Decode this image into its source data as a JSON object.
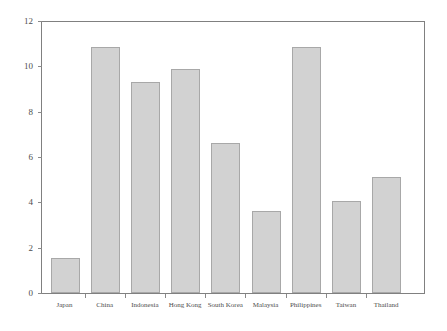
{
  "chart_data": {
    "type": "bar",
    "title": "",
    "subtitle": "",
    "xlabel": "",
    "ylabel": "",
    "categories": [
      "Japan",
      "China",
      "Indonesia",
      "Hong Kong",
      "South Korea",
      "Malaysia",
      "Philippines",
      "Taiwan",
      "Thailand"
    ],
    "values": [
      1.55,
      10.85,
      9.3,
      9.9,
      6.6,
      3.6,
      10.85,
      4.05,
      5.1
    ],
    "series": [
      {
        "name": "",
        "values": [
          1.55,
          10.85,
          9.3,
          9.9,
          6.6,
          3.6,
          10.85,
          4.05,
          5.1
        ]
      }
    ],
    "ylim": [
      0,
      12
    ],
    "yticks": [
      0,
      2,
      4,
      6,
      8,
      10,
      12
    ],
    "ytick_labels": [
      "0",
      "2",
      "4",
      "6",
      "8",
      "10",
      "12"
    ],
    "xtick_labels": [
      "Japan",
      "China",
      "Indonesia",
      "Hong Kong",
      "South Korea",
      "Malaysia",
      "Philippines",
      "Taiwan",
      "Thailand"
    ],
    "grid": false,
    "legend": false,
    "legend_position": "none",
    "bar_fill_color": "#d2d2d2",
    "bar_edge_color": "#a8a8a8",
    "axis_color": "#808080",
    "text_color": "#4d4d4d",
    "background_color": "#ffffff",
    "annotations": []
  },
  "figure": {
    "plot_left_px": 41,
    "plot_right_px": 424,
    "plot_top_px": 21,
    "plot_bottom_px": 293
  }
}
